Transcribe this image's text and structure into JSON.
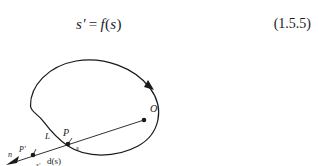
{
  "equation": {
    "lhs": "s′",
    "operator": "=",
    "rhs_function": "f",
    "rhs_open": "(",
    "rhs_arg": "s",
    "rhs_close": ")",
    "number": "(1.5.5)"
  },
  "figure": {
    "caption": "",
    "curve_label": "closed-orbit-curve",
    "direction_arrow": "clockwise",
    "points": [
      {
        "name": "O",
        "label": "O",
        "x": 144,
        "y": 70
      },
      {
        "name": "P",
        "label": "P",
        "x": 68,
        "y": 93
      },
      {
        "name": "P'",
        "label": "P′",
        "x": 33,
        "y": 104
      }
    ],
    "labels": [
      {
        "name": "point-O-label",
        "text": "O",
        "x": 150,
        "y": 62,
        "style": "italic",
        "size": 10
      },
      {
        "name": "point-P-label",
        "text": "P",
        "x": 64,
        "y": 86,
        "style": "italic",
        "size": 10
      },
      {
        "name": "point-Pprime-label",
        "text": "P′",
        "x": 21,
        "y": 102,
        "style": "italic",
        "size": 8
      },
      {
        "name": "segment-L-label",
        "text": "L",
        "x": 45,
        "y": 89,
        "style": "italic",
        "size": 9
      },
      {
        "name": "arclength-s-label",
        "text": "s",
        "x": 77,
        "y": 99,
        "style": "italic",
        "size": 7
      },
      {
        "name": "arclength-sprime-label",
        "text": "s′",
        "x": 37,
        "y": 116,
        "style": "italic",
        "size": 7
      },
      {
        "name": "distance-function-label",
        "text": "d(s)",
        "x": 48,
        "y": 113,
        "style": "upright",
        "size": 9
      },
      {
        "name": "normal-vector-n-label",
        "text": "n",
        "x": 9,
        "y": 122,
        "style": "italic",
        "size": 8
      }
    ]
  },
  "colors": {
    "ink": "#1a1a1a",
    "background": "#ffffff"
  }
}
